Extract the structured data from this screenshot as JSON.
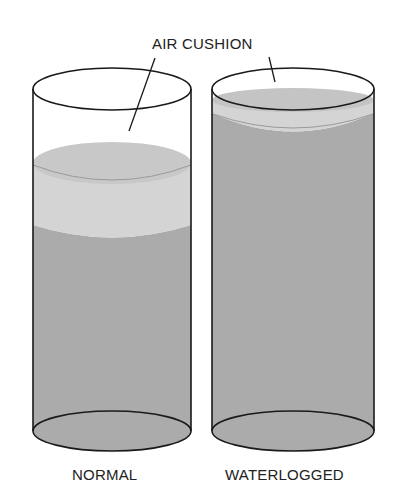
{
  "diagram": {
    "callout_label": "AIR CUSHION",
    "cylinders": [
      {
        "id": "normal",
        "label": "NORMAL",
        "description": "Soil with air cushion layer above water"
      },
      {
        "id": "waterlogged",
        "label": "WATERLOGGED",
        "description": "Soil filled with water, thin air layer at top"
      }
    ],
    "colors": {
      "outline": "#1a1a1a",
      "air_layer": "#d3d3d3",
      "water": "#ababab",
      "surface": "#c6c6c6",
      "background": "#ffffff"
    }
  }
}
